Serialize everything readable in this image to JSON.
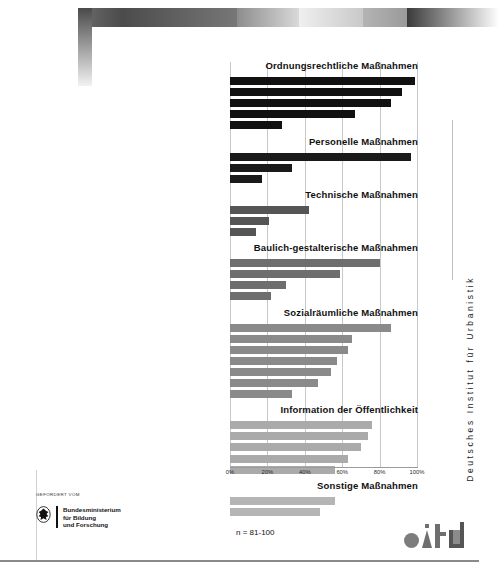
{
  "page": {
    "sample_note": "n = 81-100",
    "institute_vertical": "Deutsches Institut für Urbanistik",
    "difu_logo": "difu-logo"
  },
  "funder": {
    "eyebrow": "GEFÖRDERT VOM",
    "line1": "Bundesministerium",
    "line2": "für Bildung",
    "line3": "und Forschung",
    "emblem": "federal-eagle-icon"
  },
  "chart_data": {
    "type": "bar",
    "orientation": "horizontal",
    "title": "",
    "xlabel": "",
    "ylabel": "",
    "xlim": [
      0,
      100
    ],
    "grid": true,
    "legend": "none",
    "tick_labels": [
      "0%",
      "20%",
      "40%",
      "60%",
      "80%",
      "100%"
    ],
    "tick_values": [
      0,
      20,
      40,
      60,
      80,
      100
    ],
    "groups": [
      {
        "title": "Ordnungsrechtliche Maßnahmen",
        "color": "#111111",
        "categories": [
          "Bestrafung von Tätern",
          "Rechtliche Vorschriften zu Sonstiges",
          "Rechtliche Vorschriften Alkohol",
          "Täteransprache",
          "Kommunikation mit und Beratung von Opfern"
        ],
        "values": [
          99,
          92,
          86,
          67,
          28
        ]
      },
      {
        "title": "Personelle Maßnahmen",
        "color": "#1a1a1a",
        "categories": [
          "Präsenz vor Ort",
          "Einsatz privater Sicherheitsdienste",
          "Einsatz ehrenamtlicher Sicherheitsdienste"
        ],
        "values": [
          97,
          33,
          17
        ]
      },
      {
        "title": "Technische Maßnahmen",
        "color": "#555555",
        "categories": [
          "Investitionen in Beleuchtung",
          "Videoüberwachung/CCTV",
          "Investitionen in weitere technische Maßnahmen"
        ],
        "values": [
          42,
          21,
          14
        ]
      },
      {
        "title": "Baulich-gestalterische Maßnahmen",
        "color": "#6e6e6e",
        "categories": [
          "Pflege/Instandhaltung des öffentlichen Raumes",
          "Einsehbarkeit von Räumen",
          "Mindestanforderung für Sicherheitsaspekte in BLP",
          "Gezielte Nutzungsmischung"
        ],
        "values": [
          80,
          59,
          30,
          22
        ]
      },
      {
        "title": "Sozialräumliche Maßnahmen",
        "color": "#8a8a8a",
        "categories": [
          "Jugendarbeit",
          "Belebung des Raumes",
          "Quartiersmanagement",
          "Angebot sozialer Dienstleistungen",
          "Partizipation, Aktivierung, Empowerment",
          "Gezielte Investitionen in soziale Infrastruktur",
          "Förderung Soziale Mischung"
        ],
        "values": [
          86,
          65,
          63,
          57,
          54,
          47,
          33
        ]
      },
      {
        "title": "Information der Öffentlichkeit",
        "color": "#aaaaaa",
        "categories": [
          "Veröffentlichung von Informationsbroschüren",
          "Ordnungstelefon, Hotlines für Bürgermeldungen",
          "Internetangebot für Bürgermeldungen",
          "Präsentation des Ordnungsamtes in TV/Presse",
          "Durchführung von Informationsveranstaltungen"
        ],
        "values": [
          76,
          74,
          70,
          63,
          56
        ]
      },
      {
        "title": "Sonstige Maßnahmen",
        "color": "#b5b5b5",
        "categories": [
          "Integrierte Sicherheitskonzepte",
          "Aufbau/Pflege Datenbanken"
        ],
        "values": [
          56,
          48
        ]
      }
    ]
  }
}
